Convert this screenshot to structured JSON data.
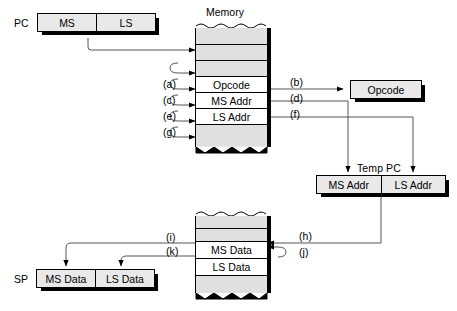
{
  "diagram": {
    "registers": {
      "pc": {
        "name": "PC",
        "fields": [
          "MS",
          "LS"
        ]
      },
      "sp": {
        "name": "SP",
        "fields": [
          "MS Data",
          "LS Data"
        ]
      },
      "temp_pc": {
        "name": "Temp PC",
        "fields": [
          "MS Addr",
          "LS Addr"
        ]
      },
      "opcode": {
        "name": "Opcode"
      }
    },
    "memory_top": {
      "title": "Memory",
      "rows": [
        "",
        "",
        "",
        "Opcode",
        "MS Addr",
        "LS Addr",
        ""
      ]
    },
    "memory_bottom": {
      "title": "",
      "rows": [
        "",
        "",
        "MS Data",
        "LS Data",
        ""
      ]
    },
    "step_labels": [
      {
        "id": "a",
        "text": "(a)"
      },
      {
        "id": "b",
        "text": "(b)"
      },
      {
        "id": "c",
        "text": "(c)"
      },
      {
        "id": "d",
        "text": "(d)"
      },
      {
        "id": "e",
        "text": "(e)"
      },
      {
        "id": "f",
        "text": "(f)"
      },
      {
        "id": "g",
        "text": "(g)"
      },
      {
        "id": "h",
        "text": "(h)"
      },
      {
        "id": "i",
        "text": "(i)"
      },
      {
        "id": "j",
        "text": "(j)"
      },
      {
        "id": "k",
        "text": "(k)"
      }
    ],
    "colors": {
      "box_fill": "#e9e9e9",
      "memory_fill": "#e0e0e0",
      "line": "#000000",
      "background": "#ffffff"
    }
  }
}
